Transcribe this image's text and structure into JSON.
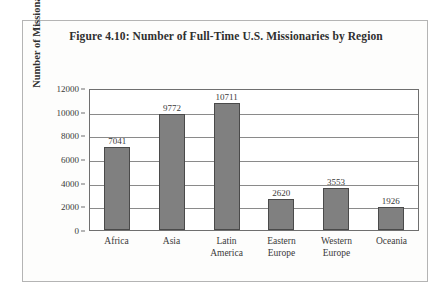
{
  "figure": {
    "title": "Figure 4.10: Number of Full-Time U.S. Missionaries by Region"
  },
  "chart_data": {
    "type": "bar",
    "title": "Figure 4.10: Number of Full-Time U.S. Missionaries by Region",
    "xlabel": "",
    "ylabel": "Number of Missionaries",
    "categories": [
      "Africa",
      "Asia",
      "Latin America",
      "Eastern Europe",
      "Western Europe",
      "Oceania"
    ],
    "category_lines": [
      [
        "Africa"
      ],
      [
        "Asia"
      ],
      [
        "Latin",
        "America"
      ],
      [
        "Eastern",
        "Europe"
      ],
      [
        "Western",
        "Europe"
      ],
      [
        "Oceania"
      ]
    ],
    "values": [
      7041,
      9772,
      10711,
      2620,
      3553,
      1926
    ],
    "data_labels": [
      "7041",
      "9772",
      "10711",
      "2620",
      "3553",
      "1926"
    ],
    "ylim": [
      0,
      12000
    ],
    "yticks": [
      0,
      2000,
      4000,
      6000,
      8000,
      10000,
      12000
    ],
    "ytick_labels": [
      "0",
      "2000",
      "4000",
      "6000",
      "8000",
      "10000",
      "12000"
    ],
    "grid": true,
    "grid_axis": "y",
    "legend": false,
    "bar_color": "#808080",
    "bar_border_color": "#4a4a4a",
    "axis_color": "#6f6f6f",
    "text_color": "#3a3a3a",
    "background": "#fdfdfc"
  }
}
